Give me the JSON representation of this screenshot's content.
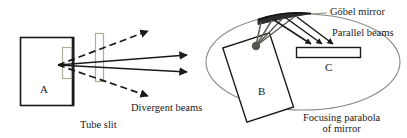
{
  "figure": {
    "width": 407,
    "height": 138,
    "background_color": "#ffffff",
    "line_color": "#1a1a1a",
    "ellipse_color": "#8a8a82",
    "slit_color": "#b0ada0",
    "mirror_color": "#2b2b2b"
  },
  "left_diagram": {
    "name": "divergent-beam-diagram",
    "box_label": "A",
    "captions": {
      "divergent_beams": "Divergent beams",
      "tube_slit": "Tube slit"
    },
    "elements": {
      "tube_box": {
        "x": 20,
        "y": 37,
        "w": 53,
        "h": 68
      },
      "slit_inner": {
        "x": 62,
        "y": 47,
        "w": 9,
        "h": 31
      },
      "slit_outer": {
        "x": 95,
        "y": 33,
        "w": 8,
        "h": 48
      },
      "source_point": {
        "x": 58,
        "y": 65
      }
    },
    "rays": [
      {
        "id": "ray-dashed-up",
        "style": "dashed",
        "x1": 58,
        "y1": 65,
        "x2": 152,
        "y2": 30
      },
      {
        "id": "ray-solid-up",
        "style": "solid",
        "x1": 58,
        "y1": 65,
        "x2": 190,
        "y2": 55
      },
      {
        "id": "ray-solid-down",
        "style": "solid",
        "x1": 58,
        "y1": 65,
        "x2": 190,
        "y2": 72
      },
      {
        "id": "ray-dashed-down",
        "style": "dashed",
        "x1": 58,
        "y1": 65,
        "x2": 152,
        "y2": 97
      }
    ]
  },
  "right_diagram": {
    "name": "goebel-mirror-diagram",
    "box_labels": {
      "source_box": "B",
      "detector_box": "C"
    },
    "captions": {
      "gobel_mirror": "Göbel mirror",
      "parallel_beams": "Parallel beams",
      "focusing_parabola_line1": "Focusing parabola",
      "focusing_parabola_line2": "of mirror"
    },
    "elements": {
      "ellipse": {
        "cx": 303,
        "cy": 62,
        "rx": 97,
        "ry": 48
      },
      "mirror": {
        "x1": 259,
        "y1": 17,
        "x2": 310,
        "y2": 14,
        "thickness": 6
      },
      "tilted_box_b": {
        "cx": 258,
        "cy": 77,
        "w": 49,
        "h": 78,
        "rotation": -18
      },
      "source_dot": {
        "x": 256,
        "y": 46,
        "r": 4
      },
      "detector_box_c": {
        "x": 296,
        "y": 47,
        "w": 64,
        "h": 10
      }
    },
    "incident_rays_count": 4,
    "parallel_rays_count": 3
  }
}
